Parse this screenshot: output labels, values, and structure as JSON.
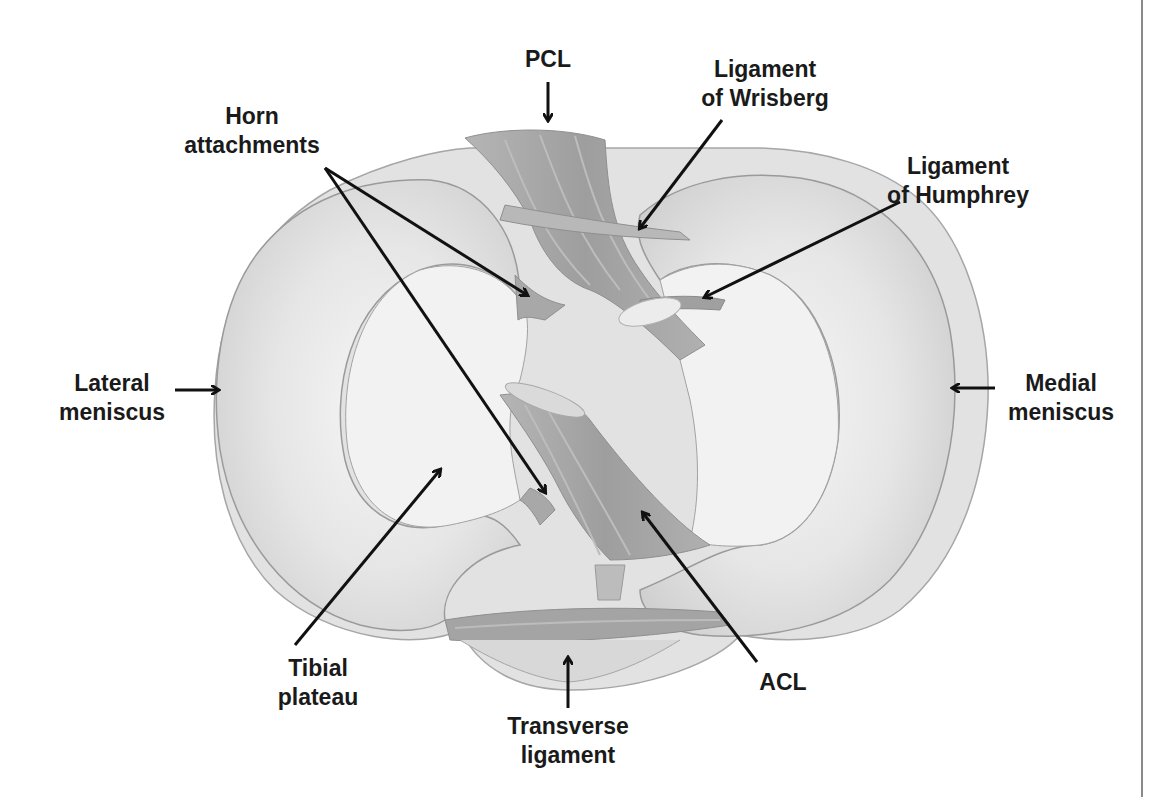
{
  "figure": {
    "colors": {
      "background": "#ffffff",
      "meniscus_fill": "#d9d9d9",
      "meniscus_inner": "#ececec",
      "plateau_fill": "#f1f1f1",
      "ligament_fill": "#a9a9a9",
      "ligament_dark": "#939393",
      "outline": "#9a9a9a",
      "text": "#1a1a1a",
      "arrow": "#111111",
      "border": "#8a8a8a"
    }
  },
  "labels": {
    "pcl": {
      "lines": [
        "PCL"
      ]
    },
    "horn_attachments": {
      "lines": [
        "Horn",
        "attachments"
      ]
    },
    "ligament_wrisberg": {
      "lines": [
        "Ligament",
        "of Wrisberg"
      ]
    },
    "ligament_humphrey": {
      "lines": [
        "Ligament",
        "of Humphrey"
      ]
    },
    "lateral_meniscus": {
      "lines": [
        "Lateral",
        "meniscus"
      ]
    },
    "medial_meniscus": {
      "lines": [
        "Medial",
        "meniscus"
      ]
    },
    "tibial_plateau": {
      "lines": [
        "Tibial",
        "plateau"
      ]
    },
    "acl": {
      "lines": [
        "ACL"
      ]
    },
    "transverse_ligament": {
      "lines": [
        "Transverse",
        "ligament"
      ]
    }
  }
}
